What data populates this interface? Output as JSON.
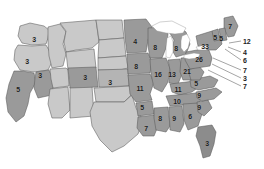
{
  "figure": {
    "type": "choropleth-map",
    "region": "United States",
    "background_color": "#ffffff",
    "border_color": "#5a5a5a",
    "lake_color": "#ffffff",
    "label_color": "#1c1c1c"
  },
  "legend_colors": {
    "light": "#c9c9c9",
    "medium": "#b4b4b4",
    "dark": "#9a9a9a",
    "darker": "#8c8c8c"
  },
  "chart_data": {
    "type": "heatmap",
    "title": "",
    "xlabel": "",
    "ylabel": "",
    "categories": [
      "WA",
      "OR",
      "CA",
      "NV",
      "ID",
      "MT",
      "WY",
      "UT",
      "AZ",
      "NM",
      "CO",
      "ND",
      "SD",
      "NE",
      "KS",
      "OK",
      "TX",
      "MN",
      "IA",
      "MO",
      "AR",
      "LA",
      "WI",
      "IL",
      "MI",
      "IN",
      "OH",
      "KY",
      "TN",
      "MS",
      "AL",
      "GA",
      "FL",
      "SC",
      "NC",
      "VA",
      "WV",
      "PA",
      "NY",
      "ME",
      "VT",
      "NH",
      "MA",
      "RI",
      "CT",
      "NJ",
      "DE",
      "MD"
    ],
    "values": [
      3,
      3,
      5,
      3,
      null,
      null,
      null,
      null,
      null,
      null,
      3,
      null,
      null,
      null,
      3,
      null,
      null,
      4,
      8,
      11,
      5,
      7,
      8,
      16,
      8,
      13,
      21,
      11,
      10,
      8,
      9,
      6,
      3,
      9,
      9,
      7,
      5,
      26,
      33,
      7,
      5,
      5,
      12,
      4,
      6,
      7,
      3,
      7
    ]
  },
  "states": [
    {
      "id": "WA",
      "name": "Washington",
      "label": "3",
      "shade": "light",
      "lx": 34,
      "ly": 39
    },
    {
      "id": "OR",
      "name": "Oregon",
      "label": "3",
      "shade": "light",
      "lx": 27,
      "ly": 61
    },
    {
      "id": "CA",
      "name": "California",
      "label": "5",
      "shade": "dark",
      "lx": 18,
      "ly": 89
    },
    {
      "id": "NV",
      "name": "Nevada",
      "label": "3",
      "shade": "dark",
      "lx": 40,
      "ly": 75
    },
    {
      "id": "ID",
      "name": "Idaho",
      "label": "",
      "shade": "light",
      "lx": 55,
      "ly": 50
    },
    {
      "id": "MT",
      "name": "Montana",
      "label": "",
      "shade": "light",
      "lx": 80,
      "ly": 35
    },
    {
      "id": "WY",
      "name": "Wyoming",
      "label": "",
      "shade": "light",
      "lx": 79,
      "ly": 58
    },
    {
      "id": "UT",
      "name": "Utah",
      "label": "",
      "shade": "light",
      "lx": 57,
      "ly": 75
    },
    {
      "id": "AZ",
      "name": "Arizona",
      "label": "",
      "shade": "light",
      "lx": 55,
      "ly": 103
    },
    {
      "id": "NM",
      "name": "New Mexico",
      "label": "",
      "shade": "light",
      "lx": 78,
      "ly": 105
    },
    {
      "id": "CO",
      "name": "Colorado",
      "label": "3",
      "shade": "dark",
      "lx": 85,
      "ly": 77
    },
    {
      "id": "ND",
      "name": "North Dakota",
      "label": "",
      "shade": "light",
      "lx": 108,
      "ly": 34
    },
    {
      "id": "SD",
      "name": "South Dakota",
      "label": "",
      "shade": "light",
      "lx": 108,
      "ly": 50
    },
    {
      "id": "NE",
      "name": "Nebraska",
      "label": "",
      "shade": "light",
      "lx": 108,
      "ly": 64
    },
    {
      "id": "KS",
      "name": "Kansas",
      "label": "3",
      "shade": "medium",
      "lx": 110,
      "ly": 82
    },
    {
      "id": "OK",
      "name": "Oklahoma",
      "label": "",
      "shade": "light",
      "lx": 110,
      "ly": 97
    },
    {
      "id": "TX",
      "name": "Texas",
      "label": "",
      "shade": "light",
      "lx": 105,
      "ly": 124
    },
    {
      "id": "MN",
      "name": "Minnesota",
      "label": "4",
      "shade": "dark",
      "lx": 135,
      "ly": 41
    },
    {
      "id": "IA",
      "name": "Iowa",
      "label": "8",
      "shade": "dark",
      "lx": 136,
      "ly": 66
    },
    {
      "id": "MO",
      "name": "Missouri",
      "label": "11",
      "shade": "dark",
      "lx": 140,
      "ly": 88
    },
    {
      "id": "AR",
      "name": "Arkansas",
      "label": "5",
      "shade": "dark",
      "lx": 142,
      "ly": 107
    },
    {
      "id": "LA",
      "name": "Louisiana",
      "label": "7",
      "shade": "dark",
      "lx": 146,
      "ly": 128
    },
    {
      "id": "WI",
      "name": "Wisconsin",
      "label": "8",
      "shade": "dark",
      "lx": 155,
      "ly": 47
    },
    {
      "id": "IL",
      "name": "Illinois",
      "label": "16",
      "shade": "dark",
      "lx": 158,
      "ly": 74
    },
    {
      "id": "MI",
      "name": "Michigan",
      "label": "8",
      "shade": "dark",
      "lx": 176,
      "ly": 48
    },
    {
      "id": "IN",
      "name": "Indiana",
      "label": "13",
      "shade": "dark",
      "lx": 172,
      "ly": 74
    },
    {
      "id": "OH",
      "name": "Ohio",
      "label": "21",
      "shade": "dark",
      "lx": 187,
      "ly": 71
    },
    {
      "id": "KY",
      "name": "Kentucky",
      "label": "11",
      "shade": "dark",
      "lx": 178,
      "ly": 89
    },
    {
      "id": "TN",
      "name": "Tennessee",
      "label": "10",
      "shade": "dark",
      "lx": 177,
      "ly": 101
    },
    {
      "id": "MS",
      "name": "Mississippi",
      "label": "8",
      "shade": "dark",
      "lx": 160,
      "ly": 118
    },
    {
      "id": "AL",
      "name": "Alabama",
      "label": "9",
      "shade": "dark",
      "lx": 174,
      "ly": 118
    },
    {
      "id": "GA",
      "name": "Georgia",
      "label": "6",
      "shade": "dark",
      "lx": 190,
      "ly": 116
    },
    {
      "id": "FL",
      "name": "Florida",
      "label": "3",
      "shade": "darker",
      "lx": 207,
      "ly": 143
    },
    {
      "id": "SC",
      "name": "South Carolina",
      "label": "9",
      "shade": "dark",
      "lx": 199,
      "ly": 107
    },
    {
      "id": "NC",
      "name": "North Carolina",
      "label": "9",
      "shade": "dark",
      "lx": 199,
      "ly": 95
    },
    {
      "id": "VA",
      "name": "Virginia",
      "label": "5",
      "shade": "dark",
      "lx": 196,
      "ly": 83
    },
    {
      "id": "WV",
      "name": "West Virginia",
      "label": "",
      "shade": "dark",
      "lx": 193,
      "ly": 78
    },
    {
      "id": "PA",
      "name": "Pennsylvania",
      "label": "26",
      "shade": "dark",
      "lx": 199,
      "ly": 59
    },
    {
      "id": "NY",
      "name": "New York",
      "label": "33",
      "shade": "dark",
      "lx": 205,
      "ly": 46
    },
    {
      "id": "ME",
      "name": "Maine",
      "label": "7",
      "shade": "dark",
      "lx": 230,
      "ly": 26
    },
    {
      "id": "VT",
      "name": "Vermont",
      "label": "5",
      "shade": "dark",
      "lx": 215,
      "ly": 37
    },
    {
      "id": "NH",
      "name": "New Hampshire",
      "label": "5",
      "shade": "dark",
      "lx": 221,
      "ly": 38
    }
  ],
  "callouts": [
    {
      "id": "MA",
      "name": "Massachusetts",
      "label": "12",
      "tx": 243,
      "ty": 41,
      "x1": 241,
      "y1": 41,
      "x2": 229,
      "y2": 43
    },
    {
      "id": "RI",
      "name": "Rhode Island",
      "label": "4",
      "tx": 243,
      "ty": 52,
      "x1": 241,
      "y1": 52,
      "x2": 228,
      "y2": 47
    },
    {
      "id": "CT",
      "name": "Connecticut",
      "label": "6",
      "tx": 243,
      "ty": 60,
      "x1": 241,
      "y1": 60,
      "x2": 225,
      "y2": 49
    },
    {
      "id": "NJ",
      "name": "New Jersey",
      "label": "7",
      "tx": 243,
      "ty": 70,
      "x1": 241,
      "y1": 70,
      "x2": 213,
      "y2": 58
    },
    {
      "id": "DE",
      "name": "Delaware",
      "label": "3",
      "tx": 243,
      "ty": 78,
      "x1": 241,
      "y1": 78,
      "x2": 212,
      "y2": 64
    },
    {
      "id": "MD",
      "name": "Maryland",
      "label": "7",
      "tx": 243,
      "ty": 86,
      "x1": 241,
      "y1": 86,
      "x2": 208,
      "y2": 70
    }
  ]
}
